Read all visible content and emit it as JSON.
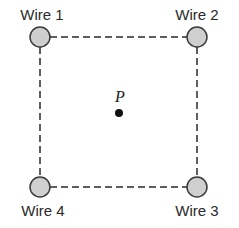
{
  "diagram": {
    "wires": [
      {
        "label": "Wire 1",
        "cx": 40,
        "cy": 37
      },
      {
        "label": "Wire 2",
        "cx": 197,
        "cy": 37
      },
      {
        "label": "Wire 3",
        "cx": 197,
        "cy": 187
      },
      {
        "label": "Wire 4",
        "cx": 40,
        "cy": 187
      }
    ],
    "point": {
      "label": "P",
      "cx": 119,
      "cy": 113
    },
    "colors": {
      "wire_fill": "#cfcfcf",
      "wire_stroke": "#3a3a3a",
      "line": "#2a2a2a"
    }
  }
}
